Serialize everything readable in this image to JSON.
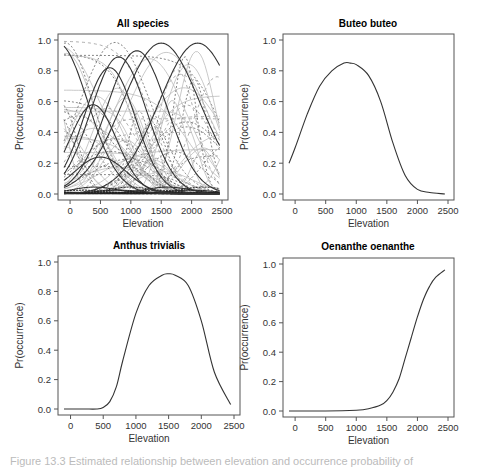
{
  "figure": {
    "caption": "Figure 13.3  Estimated relationship between elevation and occurrence probability of"
  },
  "chart_data": [
    {
      "type": "line",
      "title": "All species",
      "xlabel": "Elevation",
      "ylabel": "Pr(occurrence)",
      "xlim": [
        -100,
        2500
      ],
      "ylim": [
        0,
        1
      ],
      "xticks": [
        0,
        500,
        1000,
        1500,
        2000,
        2500
      ],
      "yticks": [
        "0.0",
        "0.2",
        "0.4",
        "0.6",
        "0.8",
        "1.0"
      ],
      "grid": false,
      "note": "Many overlaid species response curves (solid dark, dashed, light grey)",
      "series": [
        {
          "name": "curve-a",
          "peak_x": 650,
          "peak_y": 0.82,
          "width": 600,
          "style": "solid"
        },
        {
          "name": "curve-b",
          "peak_x": 800,
          "peak_y": 0.89,
          "width": 650,
          "style": "solid"
        },
        {
          "name": "curve-c",
          "peak_x": 1100,
          "peak_y": 0.93,
          "width": 700,
          "style": "solid"
        },
        {
          "name": "curve-d",
          "peak_x": 380,
          "peak_y": 0.58,
          "width": 550,
          "style": "solid"
        },
        {
          "name": "curve-e",
          "peak_x": 500,
          "peak_y": 0.24,
          "width": 600,
          "style": "solid"
        },
        {
          "name": "curve-f",
          "peak_x": 1500,
          "peak_y": 0.98,
          "width": 900,
          "style": "solid"
        },
        {
          "name": "curve-g",
          "peak_x": -200,
          "peak_y": 0.98,
          "width": 700,
          "style": "solid"
        },
        {
          "name": "curve-h",
          "peak_x": 2100,
          "peak_y": 0.98,
          "width": 900,
          "style": "solid"
        }
      ]
    },
    {
      "type": "line",
      "title": "Buteo buteo",
      "xlabel": "Elevation",
      "ylabel": "Pr(occurrence)",
      "xlim": [
        -100,
        2500
      ],
      "ylim": [
        0,
        1
      ],
      "xticks": [
        0,
        500,
        1000,
        1500,
        2000,
        2500
      ],
      "yticks": [
        "0.0",
        "0.2",
        "0.4",
        "0.6",
        "0.8",
        "1.0"
      ],
      "x": [
        -100,
        0,
        200,
        400,
        600,
        800,
        900,
        1000,
        1200,
        1400,
        1600,
        1800,
        2000,
        2200,
        2450
      ],
      "values": [
        0.2,
        0.3,
        0.52,
        0.7,
        0.8,
        0.85,
        0.85,
        0.84,
        0.77,
        0.6,
        0.33,
        0.12,
        0.03,
        0.01,
        0.0
      ]
    },
    {
      "type": "line",
      "title": "Anthus trivialis",
      "xlabel": "Elevation",
      "ylabel": "Pr(occurrence)",
      "xlim": [
        -100,
        2500
      ],
      "ylim": [
        0,
        1
      ],
      "xticks": [
        0,
        500,
        1000,
        1500,
        2000,
        2500
      ],
      "yticks": [
        "0.0",
        "0.2",
        "0.4",
        "0.6",
        "0.8",
        "1.0"
      ],
      "x": [
        -100,
        200,
        400,
        500,
        600,
        700,
        800,
        1000,
        1200,
        1400,
        1500,
        1600,
        1800,
        2000,
        2200,
        2450
      ],
      "values": [
        0.0,
        0.0,
        0.0,
        0.01,
        0.05,
        0.15,
        0.33,
        0.65,
        0.84,
        0.91,
        0.92,
        0.91,
        0.84,
        0.6,
        0.25,
        0.03
      ]
    },
    {
      "type": "line",
      "title": "Oenanthe oenanthe",
      "xlabel": "Elevation",
      "ylabel": "Pr(occurrence)",
      "xlim": [
        -100,
        2500
      ],
      "ylim": [
        0,
        1
      ],
      "xticks": [
        0,
        500,
        1000,
        1500,
        2000,
        2500
      ],
      "yticks": [
        "0.0",
        "0.2",
        "0.4",
        "0.6",
        "0.8",
        "1.0"
      ],
      "x": [
        -100,
        500,
        1000,
        1200,
        1400,
        1500,
        1600,
        1700,
        1800,
        1900,
        2000,
        2100,
        2200,
        2300,
        2450
      ],
      "values": [
        0.0,
        0.0,
        0.005,
        0.015,
        0.04,
        0.07,
        0.13,
        0.22,
        0.36,
        0.5,
        0.64,
        0.76,
        0.85,
        0.91,
        0.96
      ]
    }
  ]
}
